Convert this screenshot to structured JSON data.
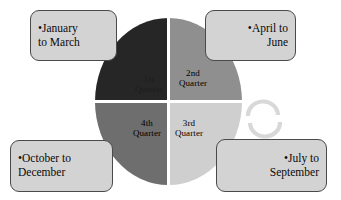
{
  "diagram": {
    "center_icon": "cycle-arrows-icon"
  },
  "pie": {
    "type": "pie",
    "segments": [
      {
        "id": "q1",
        "label_line1": "1st",
        "label_line2": "Quarter",
        "color": "#262626",
        "position": "top-left",
        "share_pct": 25
      },
      {
        "id": "q2",
        "label_line1": "2nd",
        "label_line2": "Quarter",
        "color": "#8f8f8f",
        "position": "top-right",
        "share_pct": 25
      },
      {
        "id": "q3",
        "label_line1": "3rd",
        "label_line2": "Quarter",
        "color": "#cfcfcf",
        "position": "bottom-right",
        "share_pct": 25
      },
      {
        "id": "q4",
        "label_line1": "4th",
        "label_line2": "Quarter",
        "color": "#6e6e6e",
        "position": "bottom-left",
        "share_pct": 25
      }
    ]
  },
  "callouts": [
    {
      "id": "top-left",
      "bullet": "•",
      "line1": "January",
      "line2": "to March",
      "quarter": "1st Quarter"
    },
    {
      "id": "top-right",
      "bullet": "•",
      "line1": "April to",
      "line2": "June",
      "quarter": "2nd Quarter"
    },
    {
      "id": "bottom-right",
      "bullet": "•",
      "line1": "July to",
      "line2": "September",
      "quarter": "3rd Quarter"
    },
    {
      "id": "bottom-left",
      "bullet": "•",
      "line1": "October to",
      "line2": "December",
      "quarter": "4th Quarter"
    }
  ],
  "colors": {
    "background": "#ffffff",
    "box_fill": "#d3d3d3",
    "box_border": "#4a4a4a",
    "text": "#0a0a0a",
    "arc": "#d8d8d8"
  }
}
